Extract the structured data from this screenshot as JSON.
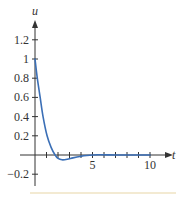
{
  "chart_data": {
    "type": "line",
    "title": "",
    "xlabel": "t",
    "ylabel": "u",
    "xlim": [
      -1.3,
      11.8
    ],
    "ylim": [
      -0.33,
      1.4
    ],
    "x_ticks": [
      1,
      2,
      3,
      4,
      5,
      6,
      7,
      8,
      9,
      10
    ],
    "x_tick_labels": [
      {
        "value": 5,
        "label": "5"
      },
      {
        "value": 10,
        "label": "10"
      }
    ],
    "y_ticks": [
      -0.2,
      0.2,
      0.4,
      0.6,
      0.8,
      1,
      1.2
    ],
    "y_tick_labels": [
      {
        "value": 1.2,
        "label": "1.2"
      },
      {
        "value": 1,
        "label": "1"
      },
      {
        "value": 0.8,
        "label": "0.8"
      },
      {
        "value": 0.6,
        "label": "0.6"
      },
      {
        "value": 0.4,
        "label": "0.4"
      },
      {
        "value": 0.2,
        "label": "0.2"
      },
      {
        "value": -0.2,
        "label": "−0.2"
      }
    ],
    "grid": false,
    "legend": null,
    "series": [
      {
        "name": "u(t)",
        "color": "#3b6fb6",
        "x": [
          0,
          0.2,
          0.45,
          0.7,
          1.05,
          1.4,
          1.75,
          2.0,
          2.35,
          2.8,
          3.3,
          3.9,
          4.5,
          5.5,
          7,
          8.5,
          10
        ],
        "y": [
          1.0,
          0.8,
          0.6,
          0.4,
          0.2,
          0.08,
          0.0,
          -0.035,
          -0.05,
          -0.045,
          -0.03,
          -0.015,
          -0.005,
          0.002,
          0.0,
          0.0,
          0.0
        ]
      }
    ]
  },
  "colors": {
    "axis": "#333333",
    "curve": "#3b6fb6",
    "footer_rule": "#f3ead2"
  }
}
